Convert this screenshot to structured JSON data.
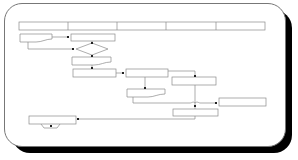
{
  "diagram": {
    "type": "swimlane-flowchart",
    "swimlanes": {
      "count": 5,
      "labels": [
        "",
        "",
        "",
        "",
        ""
      ]
    },
    "nodes": [
      {
        "id": "doc1",
        "shape": "document",
        "label": ""
      },
      {
        "id": "proc1",
        "shape": "process",
        "label": ""
      },
      {
        "id": "dec1",
        "shape": "decision",
        "label": ""
      },
      {
        "id": "doc2",
        "shape": "document",
        "label": ""
      },
      {
        "id": "proc2",
        "shape": "process",
        "label": ""
      },
      {
        "id": "proc3",
        "shape": "process",
        "label": ""
      },
      {
        "id": "proc4",
        "shape": "process",
        "label": ""
      },
      {
        "id": "doc3",
        "shape": "document",
        "label": ""
      },
      {
        "id": "proc5",
        "shape": "process",
        "label": ""
      },
      {
        "id": "proc6",
        "shape": "process",
        "label": ""
      },
      {
        "id": "term1",
        "shape": "process-with-tab",
        "label": ""
      }
    ],
    "colors": {
      "stroke": "#888888",
      "shadow": "#000000",
      "background": "#ffffff",
      "junction": "#222222"
    }
  }
}
